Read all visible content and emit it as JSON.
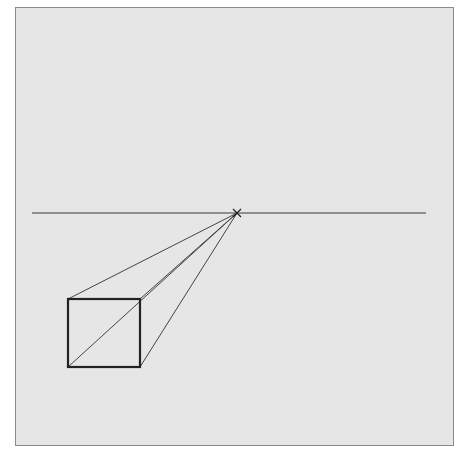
{
  "diagram": {
    "type": "one-point-perspective",
    "colors": {
      "background": "#e6e6e6",
      "border": "#8a8a8a",
      "line": "#333333",
      "box": "#222222"
    },
    "horizon": {
      "x1": 32,
      "y": 213,
      "x2": 426
    },
    "vanishing_point": {
      "x": 237,
      "y": 213
    },
    "box": {
      "x": 68,
      "y": 299,
      "width": 72,
      "height": 68
    },
    "projection_lines": [
      {
        "from": [
          68,
          299
        ],
        "to": [
          237,
          213
        ]
      },
      {
        "from": [
          140,
          299
        ],
        "to": [
          237,
          213
        ]
      },
      {
        "from": [
          68,
          367
        ],
        "to": [
          237,
          213
        ]
      },
      {
        "from": [
          140,
          367
        ],
        "to": [
          237,
          213
        ]
      }
    ]
  }
}
